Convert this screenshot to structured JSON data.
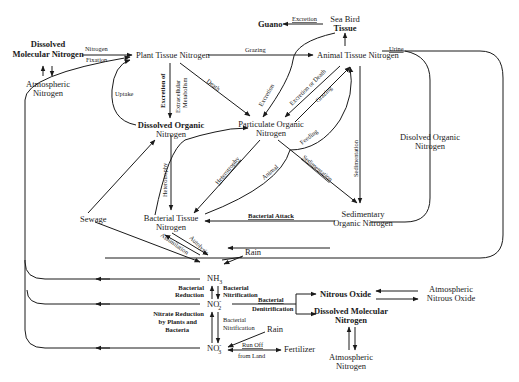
{
  "diagram": {
    "nodes": {
      "dissolved_molecular_nitrogen_top": [
        "Dissolved",
        "Molecular Nitrogen"
      ],
      "atmospheric_nitrogen_top": [
        "Atmospheric",
        "Nitrogen"
      ],
      "plant_tissue_nitrogen": "Plant Tissue Nitrogen",
      "animal_tissue_nitrogen": "Animal Tissue Nitrogen",
      "sea_bird_tissue": [
        "Sea Bird",
        "Tissue"
      ],
      "guano": "Guano",
      "dissolved_organic_nitrogen_left": [
        "Dissolved Organic",
        "Nitrogen"
      ],
      "particulate_organic_nitrogen": [
        "Particulate Organic",
        "Nitrogen"
      ],
      "dissolved_organic_nitrogen_right": [
        "Disolved Organic",
        "Nitrogen"
      ],
      "sewage": "Sewage",
      "bacterial_tissue_nitrogen": [
        "Bacterial Tissue",
        "Nitrogen"
      ],
      "sedimentary_organic_nitrogen": [
        "Sedimentary",
        "Organic Nitrogen"
      ],
      "nh3": "NH",
      "nh3_sub": "3",
      "no2": "NO",
      "no2_sup": "-",
      "no2_sub": "2",
      "no3": "NO",
      "no3_sup": "-",
      "no3_sub": "3",
      "rain_top": "Rain",
      "rain_bottom": "Rain",
      "fertilizer": "Fertilizer",
      "nitrous_oxide": "Nitrous Oxide",
      "atmospheric_nitrous_oxide": [
        "Atmospheric",
        "Nitrous Oxide"
      ],
      "dissolved_molecular_nitrogen_bottom": [
        "Dissolved Molecular",
        "Nitrogen"
      ],
      "atmospheric_nitrogen_bottom": [
        "Atmospheric",
        "Nitrogen"
      ]
    },
    "edges": {
      "nitrogen_fixation": [
        "Nitrogen",
        "Fixation"
      ],
      "grazing_top": "Grazing",
      "excretion_guano": "Excretion",
      "urine": "Urine",
      "uptake": "Uptake",
      "excretion_of": "Excretion of",
      "extracellular_metabolism": [
        "Extracellular",
        "Metabolism"
      ],
      "death": "Death",
      "excretion_bird": "Excretion",
      "excretion_or_death": "Excretion or Death",
      "grazing_mid": "Grazing",
      "feeding": "Feeding",
      "sedimentation_vertical": "Sedimentation",
      "sedimentation_diag": "Sedimentation",
      "heterotrophy_vertical": "Heterotrophy",
      "heterotrophy_diag": "Heterotrophy",
      "animal": "Animal",
      "bacterial_attack": "Bacterial Attack",
      "assimilation": "Assimilation",
      "autolysis": "Autolysis",
      "bacterial_reduction": [
        "Bacterial",
        "Reduction"
      ],
      "bacterial_nitrification_1": [
        "Bacterial",
        "Nitrification"
      ],
      "bacterial_denitrification": [
        "Bacterial",
        "Denitrification"
      ],
      "nitrate_reduction": [
        "Nitrate Reduction",
        "by Plants and",
        "Bacteria"
      ],
      "bacterial_nitrification_2": [
        "Bacterial",
        "Nitrification"
      ],
      "run_off": [
        "Run Off",
        "from Land"
      ]
    }
  }
}
